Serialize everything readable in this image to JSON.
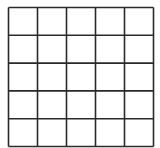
{
  "diagram": {
    "type": "grid",
    "rows": 5,
    "columns": 5,
    "line_color": "#2a2a2a",
    "cell_fill": "#ffffff"
  }
}
